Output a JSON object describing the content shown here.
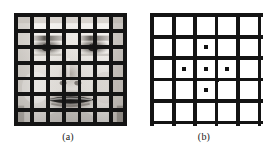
{
  "figure": {
    "background_color": "#ffffff",
    "grid_color": "#1a1a1a",
    "dot_color": "#111111",
    "panels": [
      {
        "id": "a",
        "caption": "(a)",
        "kind": "occluded-face-image",
        "description": "Grayscale frontal face photograph overlaid with a black occluding grid",
        "grid": {
          "vertical_lines": 8,
          "horizontal_lines": 8,
          "line_width_px": 4,
          "color": "#141414"
        },
        "image": {
          "type": "grayscale-face",
          "features": [
            "forehead",
            "left-eye",
            "right-eye",
            "nose",
            "mouth",
            "chin"
          ]
        }
      },
      {
        "id": "b",
        "caption": "(b)",
        "kind": "sparse-feature-map",
        "description": "Same occluding grid with sparse detected feature points marked as small black squares",
        "grid": {
          "vertical_lines": 6,
          "horizontal_lines": 6,
          "line_width_px": 4,
          "color": "#141414"
        },
        "dot_count": 9,
        "dot_size_px": 4
      }
    ]
  },
  "chart_data": {
    "type": "scatter",
    "xlabel": "",
    "ylabel": "",
    "xlim": [
      0,
      100
    ],
    "ylim": [
      0,
      100
    ],
    "grid": true,
    "legend": false,
    "gridlines": {
      "panel_a_x": [
        2,
        16,
        30,
        44,
        58,
        72,
        86,
        98
      ],
      "panel_a_y": [
        2,
        16,
        30,
        44,
        58,
        72,
        86,
        98
      ],
      "panel_b_x": [
        2,
        21,
        40,
        59,
        78,
        97
      ],
      "panel_b_y": [
        2,
        21,
        40,
        59,
        78,
        97
      ]
    },
    "series": [
      {
        "name": "feature points",
        "marker": "square",
        "color": "#111111",
        "points": [
          {
            "x": 49.5,
            "y": 30.0,
            "label": "top-center"
          },
          {
            "x": 40.0,
            "y": 40.0,
            "label": "upper-left-node"
          },
          {
            "x": 59.0,
            "y": 40.0,
            "label": "upper-right-node"
          },
          {
            "x": 30.5,
            "y": 49.5,
            "label": "mid-left"
          },
          {
            "x": 49.5,
            "y": 49.5,
            "label": "center"
          },
          {
            "x": 68.5,
            "y": 49.5,
            "label": "mid-right"
          },
          {
            "x": 40.0,
            "y": 59.0,
            "label": "lower-left-node"
          },
          {
            "x": 59.0,
            "y": 59.0,
            "label": "lower-right-node"
          },
          {
            "x": 49.5,
            "y": 68.5,
            "label": "bottom-center"
          }
        ]
      }
    ]
  }
}
